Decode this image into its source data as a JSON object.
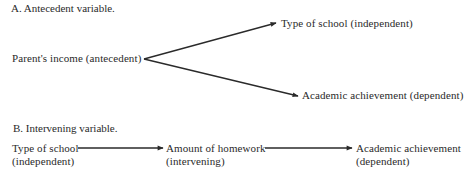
{
  "section_a": {
    "heading": "A. Antecedent variable.",
    "nodes": {
      "antecedent": "Parent's income (antecedent)",
      "independent": "Type of school (independent)",
      "dependent": "Academic achievement (dependent)"
    }
  },
  "section_b": {
    "heading": "B. Intervening variable.",
    "nodes": [
      {
        "line1": "Type of school",
        "line2": "(independent)"
      },
      {
        "line1": "Amount of homework",
        "line2": "(intervening)"
      },
      {
        "line1": "Academic achievement",
        "line2": "(dependent)"
      }
    ]
  },
  "colors": {
    "text": "#2a2a2a",
    "arrow": "#2a2a2a",
    "background": "#ffffff"
  }
}
